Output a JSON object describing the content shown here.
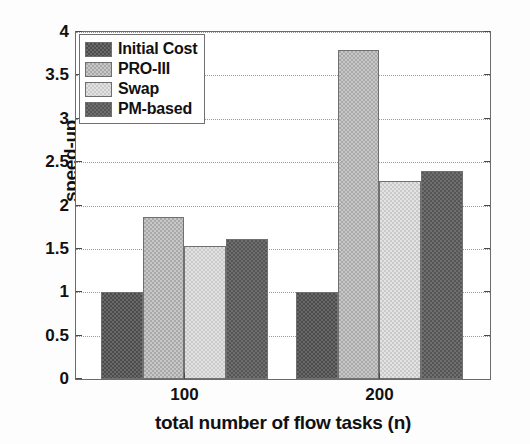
{
  "chart_data": {
    "type": "bar",
    "title": "",
    "xlabel": "total number of flow tasks (n)",
    "ylabel": "speed-up",
    "categories": [
      "100",
      "200"
    ],
    "series": [
      {
        "name": "Initial Cost",
        "values": [
          1.0,
          1.0
        ],
        "color": "#4c4c4c"
      },
      {
        "name": "PRO-III",
        "values": [
          1.87,
          3.79
        ],
        "color": "#a9a9a9"
      },
      {
        "name": "Swap",
        "values": [
          1.53,
          2.28
        ],
        "color": "#cacaca"
      },
      {
        "name": "PM-based",
        "values": [
          1.61,
          2.4
        ],
        "color": "#565656"
      }
    ],
    "ylim": [
      0,
      4
    ],
    "yticks": [
      0,
      0.5,
      1,
      1.5,
      2,
      2.5,
      3,
      3.5,
      4
    ],
    "ytick_labels": [
      "0",
      "0.5",
      "1",
      "1.5",
      "2",
      "2.5",
      "3",
      "3.5",
      "4"
    ],
    "xtick_labels": [
      "100",
      "200"
    ],
    "grid": "horizontal-dotted",
    "legend_position": "upper-left"
  },
  "legend": {
    "items": [
      {
        "label": "Initial Cost",
        "swatch": "swatch-initial-cost"
      },
      {
        "label": "PRO-III",
        "swatch": "swatch-pro-iii"
      },
      {
        "label": "Swap",
        "swatch": "swatch-swap"
      },
      {
        "label": "PM-based",
        "swatch": "swatch-pm-based"
      }
    ]
  },
  "axes": {
    "y_title": "speed-up",
    "x_title": "total number of flow tasks (n)",
    "y_labels": [
      "4",
      "3.5",
      "3",
      "2.5",
      "2",
      "1.5",
      "1",
      "0.5",
      "0"
    ],
    "x_labels": [
      "100",
      "200"
    ]
  }
}
